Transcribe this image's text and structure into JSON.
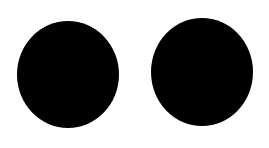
{
  "canvas": {
    "width": 269,
    "height": 148,
    "background": "#ffffff"
  },
  "shapes": [
    {
      "type": "ellipse",
      "name": "left-circle",
      "color": "#000000",
      "x": 17,
      "y": 21,
      "width": 102,
      "height": 107
    },
    {
      "type": "ellipse",
      "name": "right-circle",
      "color": "#000000",
      "x": 151,
      "y": 18,
      "width": 102,
      "height": 108
    }
  ]
}
